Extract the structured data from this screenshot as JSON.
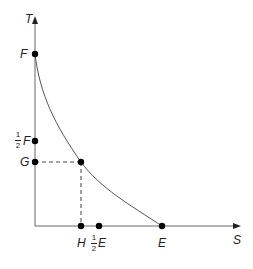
{
  "diagram": {
    "axes": {
      "y_label": "T",
      "x_label": "S"
    },
    "y_points": [
      {
        "label": "F",
        "y": 54
      },
      {
        "label": "F",
        "fraction": {
          "num": "1",
          "den": "2"
        },
        "y": 141
      },
      {
        "label": "G",
        "y": 162
      }
    ],
    "x_points": [
      {
        "label": "H",
        "x": 82
      },
      {
        "label": "E",
        "fraction": {
          "num": "1",
          "den": "2"
        },
        "x": 99
      },
      {
        "label": "E",
        "x": 162
      }
    ],
    "curve": {
      "description": "decreasing convex curve from F to E",
      "through": "(H, G)"
    },
    "colors": {
      "line": "#555555",
      "dot": "#000000",
      "text": "#222222"
    }
  }
}
